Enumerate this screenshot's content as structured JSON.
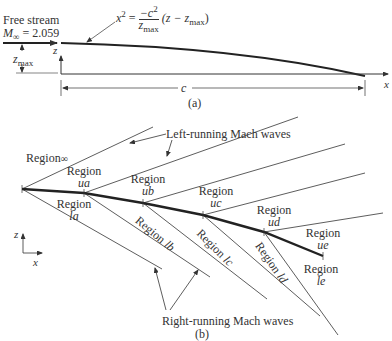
{
  "part_a": {
    "caption": "(a)",
    "free_stream_label": "Free stream",
    "mach_label": "M",
    "mach_sub": "∞",
    "mach_value": "= 2.059",
    "equation": {
      "lhs": "x",
      "lhs_sup": "2",
      "eq": "=",
      "numerator": "−c",
      "numerator_sup": "2",
      "denominator": "z",
      "denominator_sub": "max",
      "rhs": "(z − z",
      "rhs_sub": "max",
      "rhs_close": ")"
    },
    "zmax_label": "z",
    "zmax_sub": "max",
    "z_axis_label": "z",
    "x_axis_label": "x",
    "chord_label": "c"
  },
  "part_b": {
    "caption": "(b)",
    "left_running_label": "Left-running Mach waves",
    "right_running_label": "Right-running Mach waves",
    "regions_upper": [
      {
        "word": "Region",
        "id": "∞"
      },
      {
        "word": "Region",
        "id": "ua"
      },
      {
        "word": "Region",
        "id": "ub"
      },
      {
        "word": "Region",
        "id": "uc"
      },
      {
        "word": "Region",
        "id": "ud"
      },
      {
        "word": "Region",
        "id": "ue"
      }
    ],
    "regions_lower": [
      {
        "word": "Region",
        "id": "la"
      },
      {
        "word": "Region",
        "id": "lb"
      },
      {
        "word": "Region",
        "id": "lc"
      },
      {
        "word": "Region",
        "id": "ld"
      },
      {
        "word": "Region",
        "id": "le"
      }
    ],
    "axes": {
      "z": "z",
      "x": "x"
    }
  },
  "colors": {
    "line": "#333333",
    "surface": "#222222",
    "background": "#ffffff"
  }
}
